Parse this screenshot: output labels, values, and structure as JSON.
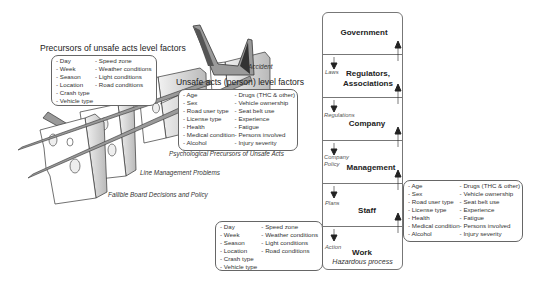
{
  "precursors": {
    "title": "Precursors of unsafe acts level factors",
    "col1": [
      "Day",
      "Week",
      "Season",
      "Location",
      "Crash type",
      "Vehicle type"
    ],
    "col2": [
      "Speed zone",
      "Weather conditions",
      "Light conditions",
      "Road conditions"
    ]
  },
  "accident_label": "Accident",
  "unsafe_acts": {
    "title": "Unsafe acts (person) level factors",
    "col1": [
      "Age",
      "Sex",
      "Road user type",
      "License type",
      "Health",
      "Medical condition",
      "Alcohol"
    ],
    "col2": [
      "Drugs (THC & other)",
      "Vehicle ownership",
      "Seat belt use",
      "Experience",
      "Fatigue",
      "Persons involved",
      "Injury severity"
    ]
  },
  "cheese_layers": {
    "layer3": "Psychological Precursors of Unsafe Acts",
    "layer2": "Line Management Problems",
    "layer1": "Fallible Board Decisions and Policy"
  },
  "hierarchy": {
    "levels": [
      {
        "name": "Government",
        "link_label": ""
      },
      {
        "name": "Regulators,\nAssociations",
        "link_label": "Laws"
      },
      {
        "name": "Company",
        "link_label": "Regulations"
      },
      {
        "name": "Management",
        "link_label": "Company\nPolicy"
      },
      {
        "name": "Staff",
        "link_label": "Plans"
      },
      {
        "name": "Work",
        "link_label": "Action"
      }
    ],
    "footer": "Hazardous process"
  },
  "work_factors": {
    "col1": [
      "Day",
      "Week",
      "Season",
      "Location",
      "Crash type",
      "Vehicle type"
    ],
    "col2": [
      "Speed zone",
      "Weather conditions",
      "Light conditions",
      "Road conditions"
    ]
  },
  "staff_factors": {
    "col1": [
      "Age",
      "Sex",
      "Road user type",
      "License type",
      "Health",
      "Medical condition",
      "Alcohol"
    ],
    "col2": [
      "Drugs (THC & other)",
      "Vehicle ownership",
      "Seat belt use",
      "Experience",
      "Fatigue",
      "Persons involved",
      "Injury severity"
    ]
  }
}
